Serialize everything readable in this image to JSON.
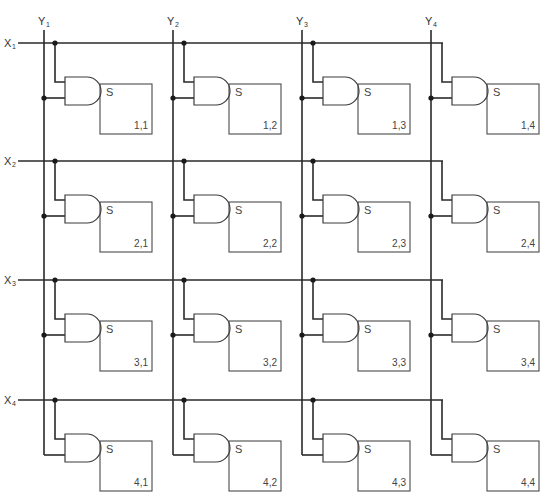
{
  "diagram": {
    "title": "",
    "columns": [
      {
        "label": "Y",
        "sub": "1",
        "x": 44
      },
      {
        "label": "Y",
        "sub": "2",
        "x": 173
      },
      {
        "label": "Y",
        "sub": "3",
        "x": 302
      },
      {
        "label": "Y",
        "sub": "4",
        "x": 431
      }
    ],
    "rows": [
      {
        "label": "X",
        "sub": "1",
        "y": 43
      },
      {
        "label": "X",
        "sub": "2",
        "y": 161
      },
      {
        "label": "X",
        "sub": "3",
        "y": 280
      },
      {
        "label": "X",
        "sub": "4",
        "y": 400
      }
    ],
    "cell_output_label": "S",
    "cells": [
      [
        "1,1",
        "1,2",
        "1,3",
        "1,4"
      ],
      [
        "2,1",
        "2,2",
        "2,3",
        "2,4"
      ],
      [
        "3,1",
        "3,2",
        "3,3",
        "3,4"
      ],
      [
        "4,1",
        "4,2",
        "4,3",
        "4,4"
      ]
    ],
    "colors": {
      "line": "#2a2a2a",
      "background": "#ffffff"
    }
  }
}
